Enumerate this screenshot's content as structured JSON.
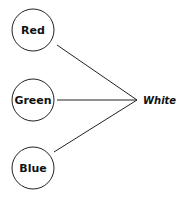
{
  "diagram": {
    "nodes": [
      {
        "id": "red",
        "label": "Red"
      },
      {
        "id": "green",
        "label": "Green"
      },
      {
        "id": "blue",
        "label": "Blue"
      }
    ],
    "target": {
      "label": "White"
    },
    "edges": [
      {
        "from": "red",
        "to": "white"
      },
      {
        "from": "green",
        "to": "white"
      },
      {
        "from": "blue",
        "to": "white"
      }
    ],
    "colors": {
      "stroke": "#222222",
      "background": "#ffffff",
      "text": "#111111"
    }
  }
}
